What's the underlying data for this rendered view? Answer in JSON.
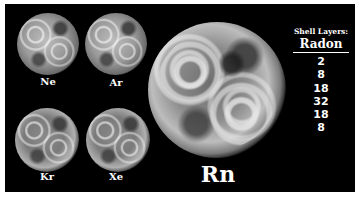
{
  "image": {
    "description": "Noble gas atoms rendered as textured dodecahedral shell spheres",
    "background_color": "#000000",
    "border_color": "#ffffff"
  },
  "atoms": [
    {
      "symbol": "Ne"
    },
    {
      "symbol": "Ar"
    },
    {
      "symbol": "Kr"
    },
    {
      "symbol": "Xe"
    },
    {
      "symbol": "Rn"
    }
  ],
  "shell_panel": {
    "title": "Shell Layers:",
    "element": "Radon",
    "layers": [
      "2",
      "8",
      "18",
      "32",
      "18",
      "8"
    ]
  }
}
